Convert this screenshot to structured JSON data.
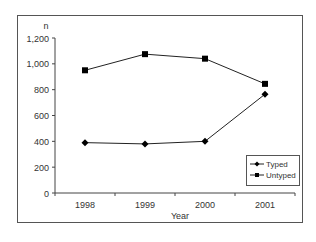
{
  "chart_data": {
    "type": "line",
    "title": "",
    "xlabel": "Year",
    "ylabel": "n",
    "categories": [
      "1998",
      "1999",
      "2000",
      "2001"
    ],
    "series": [
      {
        "name": "Typed",
        "marker": "diamond",
        "values": [
          390,
          380,
          400,
          765
        ]
      },
      {
        "name": "Untyped",
        "marker": "square",
        "values": [
          950,
          1075,
          1040,
          845
        ]
      }
    ],
    "yticks": [
      "0",
      "200",
      "400",
      "600",
      "800",
      "1,000",
      "1,200"
    ],
    "ylim": [
      0,
      1200
    ],
    "grid": false,
    "legend_position": "lower right, inside plot"
  }
}
